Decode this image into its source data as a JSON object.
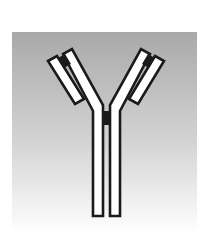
{
  "diagram": {
    "components": [
      {
        "name": "heavy-chain-left",
        "role": "stem + inner left arm"
      },
      {
        "name": "heavy-chain-right",
        "role": "stem + inner right arm"
      },
      {
        "name": "light-chain-left",
        "role": "outer left arm"
      },
      {
        "name": "light-chain-right",
        "role": "outer right arm"
      },
      {
        "name": "disulfide-bond-hinge",
        "role": "black block joining heavy chains"
      },
      {
        "name": "disulfide-bond-left",
        "role": "black block joining left light/heavy chains"
      },
      {
        "name": "disulfide-bond-right",
        "role": "black block joining right light/heavy chains"
      }
    ]
  },
  "colors": {
    "background_top": "#a9a9a9",
    "background_mid": "#d4d4d4",
    "background_bottom": "#ffffff",
    "chain_fill": "#ffffff",
    "chain_outline": "#1a1a1a",
    "bond": "#1a1a1a"
  }
}
